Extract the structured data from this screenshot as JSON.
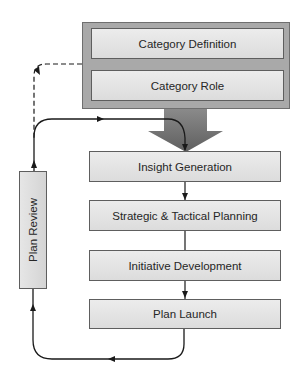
{
  "diagram": {
    "type": "process-flow",
    "top_group": {
      "items": [
        {
          "label": "Category Definition"
        },
        {
          "label": "Category Role"
        }
      ]
    },
    "steps": [
      {
        "label": "Insight Generation"
      },
      {
        "label": "Strategic & Tactical Planning"
      },
      {
        "label": "Initiative Development"
      },
      {
        "label": "Plan Launch"
      }
    ],
    "feedback": {
      "label": "Plan Review"
    },
    "colors": {
      "frame": "#a9a9a9",
      "box_fill": "#e4e4e4",
      "border": "#5e5e5e",
      "arrow": "#7a7a7a",
      "line": "#1a1a1a"
    }
  }
}
